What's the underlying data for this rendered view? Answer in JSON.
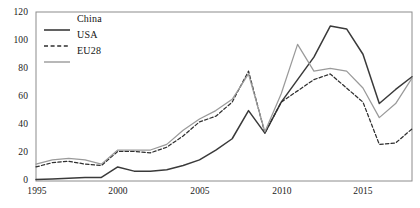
{
  "chart_data": {
    "type": "line",
    "title": "",
    "xlabel": "",
    "ylabel": "",
    "xlim": [
      1995,
      2018
    ],
    "ylim": [
      0,
      120
    ],
    "grid": false,
    "legend_position": "top-left",
    "x": [
      1995,
      1996,
      1997,
      1998,
      1999,
      2000,
      2001,
      2002,
      2003,
      2004,
      2005,
      2006,
      2007,
      2008,
      2009,
      2010,
      2011,
      2012,
      2013,
      2014,
      2015,
      2016,
      2017,
      2018
    ],
    "xticks": [
      1995,
      2000,
      2005,
      2010,
      2015
    ],
    "xtick_labels": [
      "1995",
      "2000",
      "2005",
      "2010",
      "2015"
    ],
    "yticks": [
      0,
      20,
      40,
      60,
      80,
      100,
      120
    ],
    "ytick_labels": [
      "0",
      "20",
      "40",
      "60",
      "80",
      "100",
      "120"
    ],
    "series": [
      {
        "name": "China",
        "style": "solid",
        "color": "#3a3a3a",
        "values": [
          1,
          1.5,
          2,
          2.5,
          2.5,
          10,
          7,
          7,
          8,
          11,
          15,
          22,
          30,
          50,
          34,
          56,
          72,
          88,
          110,
          108,
          90,
          55,
          65,
          74
        ]
      },
      {
        "name": "USA",
        "style": "dashed",
        "color": "#2f2f2f",
        "values": [
          10,
          13,
          14,
          12,
          11,
          21,
          21,
          20,
          24,
          32,
          42,
          46,
          56,
          78,
          34,
          56,
          64,
          72,
          76,
          66,
          56,
          26,
          27,
          37
        ]
      },
      {
        "name": "EU28",
        "style": "solid",
        "color": "#9a9a9a",
        "values": [
          12,
          15,
          16,
          15,
          12,
          22,
          22,
          22,
          26,
          36,
          44,
          50,
          58,
          76,
          35,
          62,
          97,
          78,
          80,
          78,
          66,
          45,
          55,
          73
        ]
      }
    ]
  },
  "legend": {
    "items": [
      {
        "label": "China",
        "style": "solid",
        "color": "#3a3a3a"
      },
      {
        "label": "USA",
        "style": "dashed",
        "color": "#2f2f2f"
      },
      {
        "label": "EU28",
        "style": "solid",
        "color": "#9a9a9a"
      }
    ]
  },
  "axis": {
    "y_labels": [
      "120",
      "100",
      "80",
      "60",
      "40",
      "20",
      "0"
    ],
    "x_labels": [
      "1995",
      "2000",
      "2005",
      "2010",
      "2015"
    ]
  },
  "colors": {
    "frame": "#8c8c8c",
    "china": "#3a3a3a",
    "usa": "#2f2f2f",
    "eu28": "#9a9a9a",
    "text": "#1a1a1a",
    "background": "#ffffff"
  }
}
